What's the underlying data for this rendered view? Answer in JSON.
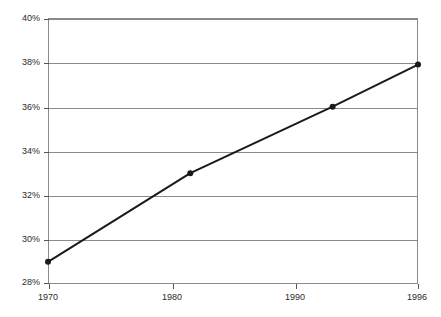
{
  "chart_data": {
    "type": "line",
    "title": "",
    "xlabel": "",
    "ylabel": "",
    "x": [
      1970,
      1980,
      1990,
      1996
    ],
    "categories": [
      "1970",
      "1980",
      "1990",
      "1996"
    ],
    "values": [
      29,
      33,
      36,
      37.9
    ],
    "series": [
      {
        "name": "",
        "values": [
          29,
          33,
          36,
          37.9
        ]
      }
    ],
    "value_labels": [
      "29%",
      "33%",
      "36%",
      "37.9%"
    ],
    "ylim": [
      28,
      40
    ],
    "xlim": [
      1970,
      1996
    ],
    "ytick_labels": [
      "28%",
      "30%",
      "32%",
      "34%",
      "36%",
      "38%",
      "40%"
    ],
    "ytick_values": [
      28,
      30,
      32,
      34,
      36,
      38,
      40
    ],
    "xtick_labels": [
      "1970",
      "1980",
      "1990",
      "1996"
    ],
    "xtick_values": [
      1970,
      1980,
      1990,
      1996
    ],
    "grid": true,
    "grid_axis": "y",
    "legend": false,
    "legend_position": "none",
    "markers": true,
    "line_color": "#1a1a1a",
    "marker_color": "#1a1a1a",
    "grid_color": "#8a8a8a",
    "axis_color": "#8a8a8a",
    "background_color": "#ffffff",
    "text_color": "#2b2b2b"
  }
}
